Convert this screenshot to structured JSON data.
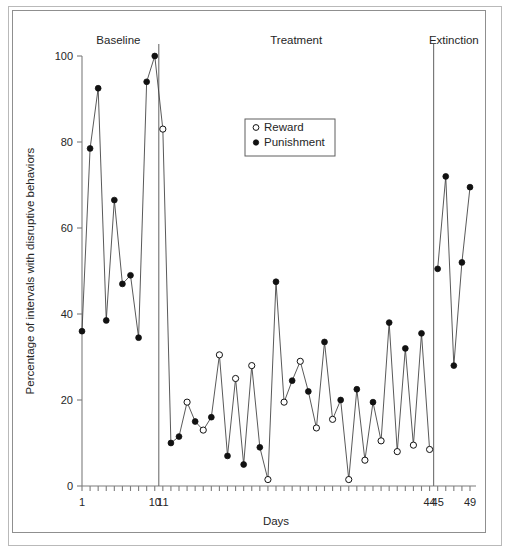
{
  "figure": {
    "frame": "double-rule-border",
    "background": "#ffffff"
  },
  "axes": {
    "y_title": "Percentage of intervals with disruptive behaviors",
    "x_title": "Days",
    "y_ticks": [
      0,
      20,
      40,
      60,
      80,
      100
    ],
    "x_tick_labels": [
      {
        "day": 1,
        "text": "1"
      },
      {
        "day": 10,
        "text": "10"
      },
      {
        "day": 11,
        "text": "11"
      },
      {
        "day": 44,
        "text": "44"
      },
      {
        "day": 45,
        "text": "45"
      },
      {
        "day": 49,
        "text": "49"
      }
    ]
  },
  "phases": [
    {
      "name": "Baseline",
      "label": "Baseline",
      "start_day": 1,
      "end_day": 10
    },
    {
      "name": "Treatment",
      "label": "Treatment",
      "start_day": 11,
      "end_day": 44
    },
    {
      "name": "Extinction",
      "label": "Extinction",
      "start_day": 45,
      "end_day": 49
    }
  ],
  "legend": {
    "position": "upper-center",
    "entries": [
      {
        "label": "Reward",
        "marker": "open-circle",
        "color": "#111111"
      },
      {
        "label": "Punishment",
        "marker": "filled-circle",
        "color": "#111111"
      }
    ]
  },
  "colors": {
    "line": "#3b3b3b",
    "marker": "#111111",
    "axis": "#7d7d7d",
    "frame_outer": "#b9b9b9",
    "frame_inner": "#8f8f8f"
  },
  "chart_data": {
    "type": "line",
    "title": "",
    "xlabel": "Days",
    "ylabel": "Percentage of intervals with disruptive behaviors",
    "xlim": [
      1,
      49
    ],
    "ylim": [
      0,
      100
    ],
    "grid": false,
    "legend_position": "upper-center",
    "x": [
      1,
      2,
      3,
      4,
      5,
      6,
      7,
      8,
      9,
      10,
      11,
      12,
      13,
      14,
      15,
      16,
      17,
      18,
      19,
      20,
      21,
      22,
      23,
      24,
      25,
      26,
      27,
      28,
      29,
      30,
      31,
      32,
      33,
      34,
      35,
      36,
      37,
      38,
      39,
      40,
      41,
      42,
      43,
      44,
      45,
      46,
      47,
      48,
      49
    ],
    "points": [
      {
        "day": 1,
        "value": 36.0,
        "marker": "filled",
        "condition": "Punishment",
        "phase": "Baseline"
      },
      {
        "day": 2,
        "value": 78.5,
        "marker": "filled",
        "condition": "Punishment",
        "phase": "Baseline"
      },
      {
        "day": 3,
        "value": 92.5,
        "marker": "filled",
        "condition": "Punishment",
        "phase": "Baseline"
      },
      {
        "day": 4,
        "value": 38.5,
        "marker": "filled",
        "condition": "Punishment",
        "phase": "Baseline"
      },
      {
        "day": 5,
        "value": 66.5,
        "marker": "filled",
        "condition": "Punishment",
        "phase": "Baseline"
      },
      {
        "day": 6,
        "value": 47.0,
        "marker": "filled",
        "condition": "Punishment",
        "phase": "Baseline"
      },
      {
        "day": 7,
        "value": 49.0,
        "marker": "filled",
        "condition": "Punishment",
        "phase": "Baseline"
      },
      {
        "day": 8,
        "value": 34.5,
        "marker": "filled",
        "condition": "Punishment",
        "phase": "Baseline"
      },
      {
        "day": 9,
        "value": 94.0,
        "marker": "filled",
        "condition": "Punishment",
        "phase": "Baseline"
      },
      {
        "day": 10,
        "value": 100.0,
        "marker": "filled",
        "condition": "Punishment",
        "phase": "Baseline"
      },
      {
        "day": 11,
        "value": 83.0,
        "marker": "open",
        "condition": "Reward",
        "phase": "Treatment"
      },
      {
        "day": 12,
        "value": 10.0,
        "marker": "filled",
        "condition": "Punishment",
        "phase": "Treatment"
      },
      {
        "day": 13,
        "value": 11.5,
        "marker": "filled",
        "condition": "Punishment",
        "phase": "Treatment"
      },
      {
        "day": 14,
        "value": 19.5,
        "marker": "open",
        "condition": "Reward",
        "phase": "Treatment"
      },
      {
        "day": 15,
        "value": 15.0,
        "marker": "filled",
        "condition": "Punishment",
        "phase": "Treatment"
      },
      {
        "day": 16,
        "value": 13.0,
        "marker": "open",
        "condition": "Reward",
        "phase": "Treatment"
      },
      {
        "day": 17,
        "value": 16.0,
        "marker": "filled",
        "condition": "Punishment",
        "phase": "Treatment"
      },
      {
        "day": 18,
        "value": 30.5,
        "marker": "open",
        "condition": "Reward",
        "phase": "Treatment"
      },
      {
        "day": 19,
        "value": 7.0,
        "marker": "filled",
        "condition": "Punishment",
        "phase": "Treatment"
      },
      {
        "day": 20,
        "value": 25.0,
        "marker": "open",
        "condition": "Reward",
        "phase": "Treatment"
      },
      {
        "day": 21,
        "value": 5.0,
        "marker": "filled",
        "condition": "Punishment",
        "phase": "Treatment"
      },
      {
        "day": 22,
        "value": 28.0,
        "marker": "open",
        "condition": "Reward",
        "phase": "Treatment"
      },
      {
        "day": 23,
        "value": 9.0,
        "marker": "filled",
        "condition": "Punishment",
        "phase": "Treatment"
      },
      {
        "day": 24,
        "value": 1.5,
        "marker": "open",
        "condition": "Reward",
        "phase": "Treatment"
      },
      {
        "day": 25,
        "value": 47.5,
        "marker": "filled",
        "condition": "Punishment",
        "phase": "Treatment"
      },
      {
        "day": 26,
        "value": 19.5,
        "marker": "open",
        "condition": "Reward",
        "phase": "Treatment"
      },
      {
        "day": 27,
        "value": 24.5,
        "marker": "filled",
        "condition": "Punishment",
        "phase": "Treatment"
      },
      {
        "day": 28,
        "value": 29.0,
        "marker": "open",
        "condition": "Reward",
        "phase": "Treatment"
      },
      {
        "day": 29,
        "value": 22.0,
        "marker": "filled",
        "condition": "Punishment",
        "phase": "Treatment"
      },
      {
        "day": 30,
        "value": 13.5,
        "marker": "open",
        "condition": "Reward",
        "phase": "Treatment"
      },
      {
        "day": 31,
        "value": 33.5,
        "marker": "filled",
        "condition": "Punishment",
        "phase": "Treatment"
      },
      {
        "day": 32,
        "value": 15.5,
        "marker": "open",
        "condition": "Reward",
        "phase": "Treatment"
      },
      {
        "day": 33,
        "value": 20.0,
        "marker": "filled",
        "condition": "Punishment",
        "phase": "Treatment"
      },
      {
        "day": 34,
        "value": 1.5,
        "marker": "open",
        "condition": "Reward",
        "phase": "Treatment"
      },
      {
        "day": 35,
        "value": 22.5,
        "marker": "filled",
        "condition": "Punishment",
        "phase": "Treatment"
      },
      {
        "day": 36,
        "value": 6.0,
        "marker": "open",
        "condition": "Reward",
        "phase": "Treatment"
      },
      {
        "day": 37,
        "value": 19.5,
        "marker": "filled",
        "condition": "Punishment",
        "phase": "Treatment"
      },
      {
        "day": 38,
        "value": 10.5,
        "marker": "open",
        "condition": "Reward",
        "phase": "Treatment"
      },
      {
        "day": 39,
        "value": 38.0,
        "marker": "filled",
        "condition": "Punishment",
        "phase": "Treatment"
      },
      {
        "day": 40,
        "value": 8.0,
        "marker": "open",
        "condition": "Reward",
        "phase": "Treatment"
      },
      {
        "day": 41,
        "value": 32.0,
        "marker": "filled",
        "condition": "Punishment",
        "phase": "Treatment"
      },
      {
        "day": 42,
        "value": 9.5,
        "marker": "open",
        "condition": "Reward",
        "phase": "Treatment"
      },
      {
        "day": 43,
        "value": 35.5,
        "marker": "filled",
        "condition": "Punishment",
        "phase": "Treatment"
      },
      {
        "day": 44,
        "value": 8.5,
        "marker": "open",
        "condition": "Reward",
        "phase": "Treatment"
      },
      {
        "day": 45,
        "value": 50.5,
        "marker": "filled",
        "condition": "Punishment",
        "phase": "Extinction"
      },
      {
        "day": 46,
        "value": 72.0,
        "marker": "filled",
        "condition": "Punishment",
        "phase": "Extinction"
      },
      {
        "day": 47,
        "value": 28.0,
        "marker": "filled",
        "condition": "Punishment",
        "phase": "Extinction"
      },
      {
        "day": 48,
        "value": 52.0,
        "marker": "filled",
        "condition": "Punishment",
        "phase": "Extinction"
      },
      {
        "day": 49,
        "value": 69.5,
        "marker": "filled",
        "condition": "Punishment",
        "phase": "Extinction"
      }
    ]
  }
}
